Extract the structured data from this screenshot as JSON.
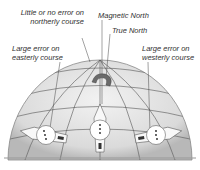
{
  "labels": {
    "little_error": [
      "Little or no error on",
      "northerly course"
    ],
    "magnetic_north": "Magnetic North",
    "true_north": "True North",
    "easterly": [
      "Large error on",
      "easterly course"
    ],
    "westerly": [
      "Large error on",
      "westerly course"
    ]
  },
  "colors": {
    "globe_fill": "#e4e4e4",
    "grid_line": "#555555",
    "magnet": "#6a6a6a",
    "text": "#333333"
  },
  "icons": [
    "globe-icon",
    "magnet-icon",
    "aircraft-icon",
    "compass-icon"
  ]
}
